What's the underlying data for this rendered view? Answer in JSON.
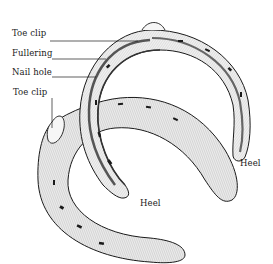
{
  "diagram": {
    "type": "labeled technical illustration",
    "labels": [
      {
        "id": "toe-clip-top",
        "text": "Toe clip"
      },
      {
        "id": "fullering",
        "text": "Fullering"
      },
      {
        "id": "nail-hole",
        "text": "Nail hole"
      },
      {
        "id": "toe-clip-left",
        "text": "Toe clip"
      },
      {
        "id": "heel-right",
        "text": "Heel"
      },
      {
        "id": "heel-center",
        "text": "Heel"
      }
    ],
    "colors": {
      "ink": "#1a1a1a",
      "metal_fill": "#e8e8e8",
      "shade": "#9a9a9a",
      "background": "#ffffff"
    }
  }
}
